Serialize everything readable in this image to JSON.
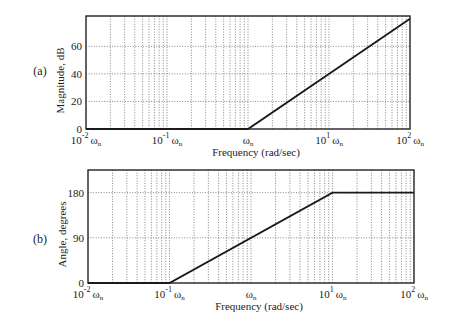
{
  "chart_data": [
    {
      "id": "a",
      "panel_label": "(a)",
      "type": "line",
      "title": "",
      "xlabel": "Frequency (rad/sec)",
      "ylabel": "Magnitude, dB",
      "xscale": "log",
      "xlim_decades": [
        -2,
        2
      ],
      "ylim": [
        0,
        82
      ],
      "yticks": [
        0,
        20,
        40,
        60
      ],
      "xtick_labels": [
        {
          "base": "10",
          "exp": "-2",
          "sym": "ωn"
        },
        {
          "base": "10",
          "exp": "-1",
          "sym": "ωn"
        },
        {
          "base": "",
          "exp": "",
          "sym": "ωn"
        },
        {
          "base": "10",
          "exp": "1",
          "sym": "ωn"
        },
        {
          "base": "10",
          "exp": "2",
          "sym": "ωn"
        }
      ],
      "grid": true,
      "series": [
        {
          "name": "asymptote",
          "x_decades": [
            -2,
            0,
            2
          ],
          "y": [
            0,
            0,
            80
          ]
        }
      ]
    },
    {
      "id": "b",
      "panel_label": "(b)",
      "type": "line",
      "title": "",
      "xlabel": "Frequency (rad/sec)",
      "ylabel": "Angle, degrees",
      "xscale": "log",
      "xlim_decades": [
        -2,
        2
      ],
      "ylim": [
        0,
        225
      ],
      "yticks": [
        0,
        90,
        180
      ],
      "xtick_labels": [
        {
          "base": "10",
          "exp": "-2",
          "sym": "ωn"
        },
        {
          "base": "10",
          "exp": "-1",
          "sym": "ωn"
        },
        {
          "base": "",
          "exp": "",
          "sym": "ωn"
        },
        {
          "base": "10",
          "exp": "1",
          "sym": "ωn"
        },
        {
          "base": "10",
          "exp": "2",
          "sym": "ωn"
        }
      ],
      "grid": true,
      "series": [
        {
          "name": "asymptote",
          "x_decades": [
            -2,
            -1,
            1,
            2
          ],
          "y": [
            0,
            0,
            180,
            180
          ]
        }
      ]
    }
  ],
  "layout": {
    "panels": [
      {
        "left": 86,
        "top": 16,
        "right": 410,
        "bottom": 129,
        "label_x": 40,
        "label_y": 75
      },
      {
        "left": 88,
        "top": 170,
        "right": 414,
        "bottom": 283,
        "label_x": 40,
        "label_y": 243
      }
    ],
    "colors": {
      "axis": "#222222",
      "grid": "#555555",
      "line": "#1a1a1a"
    }
  }
}
